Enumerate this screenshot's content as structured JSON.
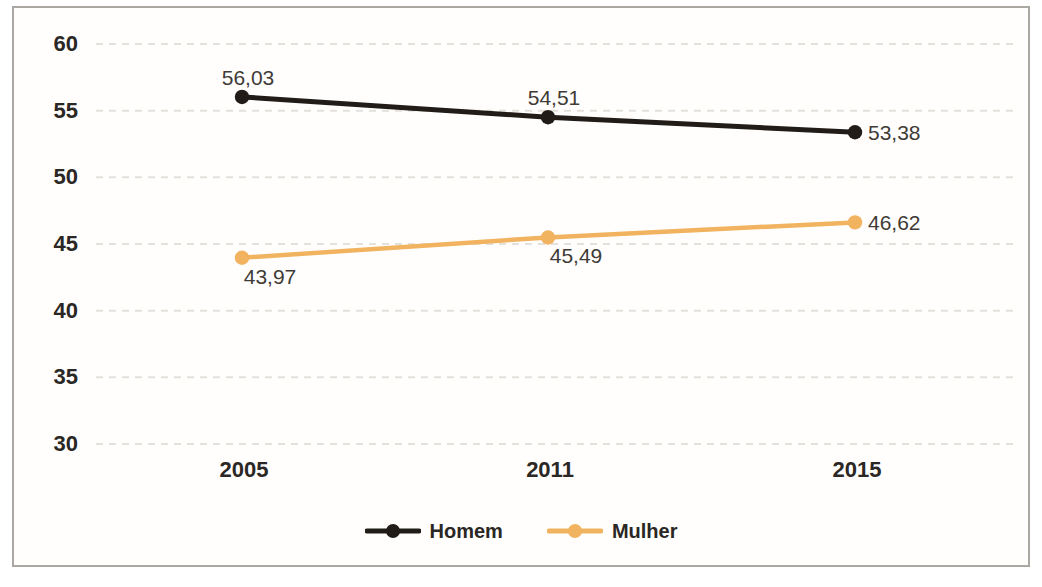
{
  "chart_data": {
    "type": "line",
    "title": "",
    "xlabel": "",
    "ylabel": "",
    "categories": [
      "2005",
      "2011",
      "2015"
    ],
    "y_ticks": [
      60,
      55,
      50,
      45,
      40,
      35,
      30
    ],
    "y_tick_labels": [
      "60",
      "55",
      "50",
      "45",
      "40",
      "35",
      "30"
    ],
    "ylim": [
      30,
      60
    ],
    "grid": "horizontal-dashed",
    "legend_position": "bottom-center",
    "decimal_separator": ",",
    "series": [
      {
        "name": "Homem",
        "color": "#211c18",
        "values": [
          56.03,
          54.51,
          53.38
        ],
        "point_labels": [
          "56,03",
          "54,51",
          "53,38"
        ],
        "label_anchors": [
          "above",
          "above",
          "right"
        ]
      },
      {
        "name": "Mulher",
        "color": "#f1b35f",
        "values": [
          43.97,
          45.49,
          46.62
        ],
        "point_labels": [
          "43,97",
          "45,49",
          "46,62"
        ],
        "label_anchors": [
          "below",
          "below",
          "right"
        ]
      }
    ]
  },
  "colors": {
    "background": "#ffffff",
    "frame_border": "#aba7a2",
    "grid_line": "#e4e1dc",
    "tick_text": "#2b2724",
    "data_label_text": "#403b36"
  }
}
